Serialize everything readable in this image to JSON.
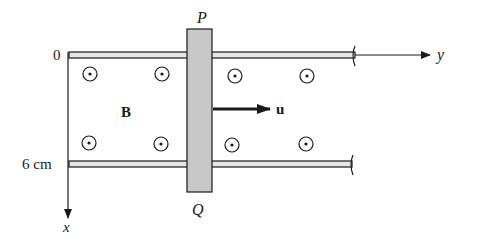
{
  "figure": {
    "labels": {
      "origin": "0",
      "rail_separation": "6 cm",
      "x_axis": "x",
      "y_axis": "y",
      "bar_top": "P",
      "bar_bottom": "Q",
      "field": "B",
      "velocity": "u"
    },
    "field_direction": "out-of-page",
    "field_symbol_count": 8,
    "colors": {
      "ink": "#1a1a1a",
      "bar_fill": "#c8c8c8",
      "rail_fill": "#e6e6e6",
      "background": "#ffffff"
    }
  }
}
